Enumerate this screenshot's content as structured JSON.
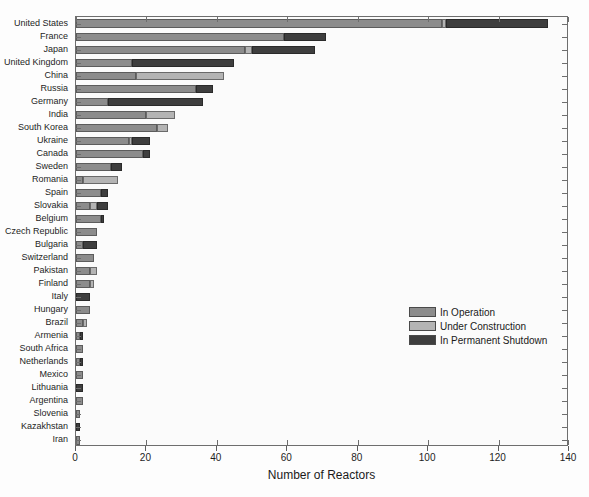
{
  "chart_data": {
    "type": "bar",
    "orientation": "horizontal",
    "stacked": true,
    "title": "",
    "xlabel": "Number of Reactors",
    "ylabel": "",
    "xlim": [
      0,
      140
    ],
    "xticks": [
      0,
      20,
      40,
      60,
      80,
      100,
      120,
      140
    ],
    "grid": false,
    "legend_position": "center-right",
    "categories": [
      "United States",
      "France",
      "Japan",
      "United Kingdom",
      "China",
      "Russia",
      "Germany",
      "India",
      "South Korea",
      "Ukraine",
      "Canada",
      "Sweden",
      "Romania",
      "Spain",
      "Slovakia",
      "Belgium",
      "Czech Republic",
      "Bulgaria",
      "Switzerland",
      "Pakistan",
      "Finland",
      "Italy",
      "Hungary",
      "Brazil",
      "Armenia",
      "South Africa",
      "Netherlands",
      "Mexico",
      "Lithuania",
      "Argentina",
      "Slovenia",
      "Kazakhstan",
      "Iran"
    ],
    "series": [
      {
        "name": "In Operation",
        "color": "#8c8c8c",
        "values": [
          104,
          59,
          48,
          16,
          17,
          34,
          9,
          20,
          23,
          15,
          19,
          10,
          2,
          7,
          4,
          7,
          6,
          2,
          5,
          4,
          4,
          0,
          4,
          2,
          1,
          2,
          1,
          2,
          0,
          2,
          1,
          0,
          1
        ]
      },
      {
        "name": "Under Construction",
        "color": "#b4b4b4",
        "values": [
          1,
          0,
          2,
          0,
          25,
          0,
          0,
          8,
          3,
          1,
          0,
          0,
          10,
          0,
          2,
          0,
          0,
          0,
          0,
          2,
          1,
          0,
          0,
          1,
          0,
          0,
          0,
          0,
          0,
          0,
          0,
          0,
          0
        ]
      },
      {
        "name": "In Permanent Shutdown",
        "color": "#3e3e3e",
        "values": [
          29,
          12,
          18,
          29,
          0,
          5,
          27,
          0,
          0,
          5,
          2,
          3,
          0,
          2,
          3,
          1,
          0,
          4,
          0,
          0,
          0,
          4,
          0,
          0,
          1,
          0,
          1,
          0,
          2,
          0,
          0,
          1,
          0
        ]
      }
    ]
  },
  "axis": {
    "x_title": "Number of Reactors",
    "x_tick_labels": [
      "0",
      "20",
      "40",
      "60",
      "80",
      "100",
      "120",
      "140"
    ]
  },
  "legend": {
    "items": [
      {
        "label": "In Operation",
        "color": "#8c8c8c"
      },
      {
        "label": "Under Construction",
        "color": "#b4b4b4"
      },
      {
        "label": "In Permanent Shutdown",
        "color": "#3e3e3e"
      }
    ]
  }
}
